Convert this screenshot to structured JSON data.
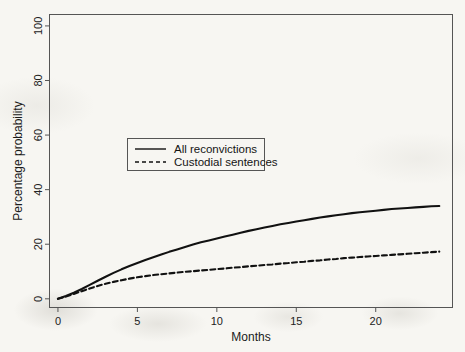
{
  "chart_data": {
    "type": "line",
    "title": "",
    "xlabel": "Months",
    "ylabel": "Percentage probability",
    "xlim": [
      -0.5,
      24.8
    ],
    "ylim": [
      -3,
      104
    ],
    "xticks": [
      0,
      5,
      10,
      15,
      20
    ],
    "xtick_labels": [
      "0",
      "5",
      "10",
      "15",
      "20"
    ],
    "yticks": [
      0,
      20,
      40,
      60,
      80,
      100
    ],
    "ytick_labels": [
      "0",
      "20",
      "40",
      "60",
      "80",
      "100"
    ],
    "grid": false,
    "legend_position": "upper center",
    "x": [
      0,
      0.5,
      1,
      1.5,
      2,
      2.5,
      3,
      3.5,
      4,
      4.5,
      5,
      5.5,
      6,
      6.5,
      7,
      7.5,
      8,
      8.5,
      9,
      9.5,
      10,
      10.5,
      11,
      11.5,
      12,
      12.5,
      13,
      13.5,
      14,
      14.5,
      15,
      15.5,
      16,
      16.5,
      17,
      17.5,
      18,
      18.5,
      19,
      19.5,
      20,
      20.5,
      21,
      21.5,
      22,
      22.5,
      23,
      23.5,
      24
    ],
    "series": [
      {
        "name": "All reconvictions",
        "style": "solid",
        "color": "#111111",
        "values": [
          0.0,
          1.0,
          2.2,
          3.6,
          5.1,
          6.6,
          8.1,
          9.5,
          10.8,
          12.0,
          13.1,
          14.2,
          15.2,
          16.2,
          17.2,
          18.1,
          19.0,
          19.9,
          20.7,
          21.4,
          22.1,
          22.8,
          23.5,
          24.2,
          24.9,
          25.5,
          26.1,
          26.7,
          27.3,
          27.8,
          28.3,
          28.8,
          29.3,
          29.8,
          30.2,
          30.6,
          31.0,
          31.4,
          31.7,
          32.0,
          32.3,
          32.6,
          32.9,
          33.1,
          33.3,
          33.5,
          33.7,
          33.9,
          34.0
        ]
      },
      {
        "name": "Custodial sentences",
        "style": "dashed",
        "color": "#111111",
        "values": [
          0.0,
          0.8,
          1.8,
          2.8,
          3.8,
          4.7,
          5.5,
          6.2,
          6.8,
          7.4,
          7.9,
          8.3,
          8.7,
          9.0,
          9.3,
          9.6,
          9.9,
          10.1,
          10.4,
          10.6,
          10.9,
          11.1,
          11.4,
          11.6,
          11.9,
          12.1,
          12.4,
          12.6,
          12.9,
          13.1,
          13.4,
          13.6,
          13.9,
          14.1,
          14.4,
          14.6,
          14.9,
          15.1,
          15.3,
          15.5,
          15.7,
          15.9,
          16.1,
          16.3,
          16.5,
          16.7,
          16.9,
          17.1,
          17.3
        ]
      }
    ],
    "legend_entries": [
      {
        "label": "All reconvictions",
        "style": "solid"
      },
      {
        "label": "Custodial sentences",
        "style": "dashed"
      }
    ]
  }
}
